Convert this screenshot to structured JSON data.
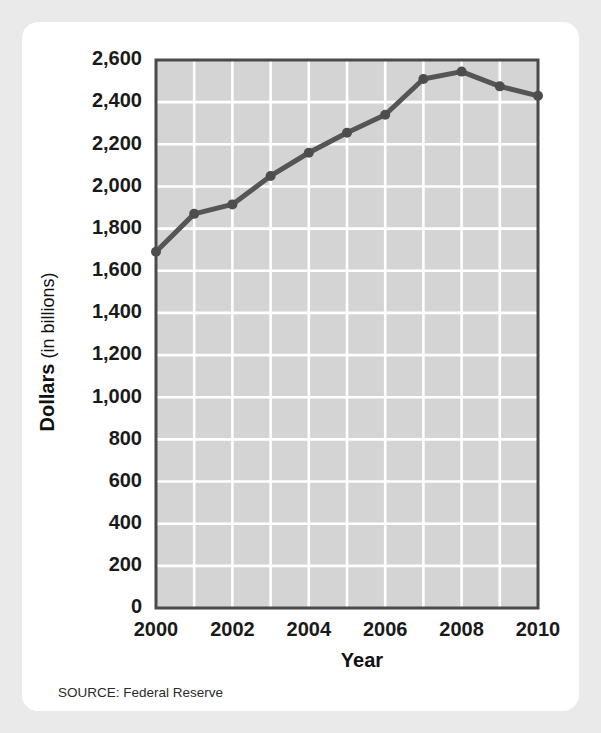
{
  "chart_data": {
    "type": "line",
    "title": "",
    "xlabel": "Year",
    "ylabel": "Dollars (in billions)",
    "ylabel_bold_part": "Dollars",
    "ylabel_regular_part": "(in billions)",
    "x": [
      2000,
      2001,
      2002,
      2003,
      2004,
      2005,
      2006,
      2007,
      2008,
      2009,
      2010
    ],
    "values": [
      1690,
      1870,
      1915,
      2050,
      2160,
      2255,
      2340,
      2510,
      2545,
      2475,
      2430
    ],
    "series": [
      {
        "name": "Dollars (in billions)",
        "values": [
          1690,
          1870,
          1915,
          2050,
          2160,
          2255,
          2340,
          2510,
          2545,
          2475,
          2430
        ]
      }
    ],
    "xlim": [
      2000,
      2010
    ],
    "ylim": [
      0,
      2600
    ],
    "ytick_values": [
      0,
      200,
      400,
      600,
      800,
      1000,
      1200,
      1400,
      1600,
      1800,
      2000,
      2200,
      2400,
      2600
    ],
    "ytick_labels": [
      "0",
      "200",
      "400",
      "600",
      "800",
      "1,000",
      "1,200",
      "1,400",
      "1,600",
      "1,800",
      "2,000",
      "2,200",
      "2,400",
      "2,600"
    ],
    "xtick_values": [
      2000,
      2002,
      2004,
      2006,
      2008,
      2010
    ],
    "xtick_labels": [
      "2000",
      "2002",
      "2004",
      "2006",
      "2008",
      "2010"
    ],
    "grid": true,
    "grid_color": "#ffffff",
    "plot_background": "#d4d4d4",
    "line_color": "#555555",
    "marker_color": "#4d4d4d",
    "legend": null,
    "legend_position": "none",
    "annotations": []
  },
  "source": {
    "label": "SOURCE: Federal Reserve"
  },
  "colors": {
    "page_background": "#eaeaea",
    "card_background": "#ffffff",
    "text": "#1a1a1a",
    "plot_fill": "#d4d4d4",
    "frame": "#4a4a4a",
    "grid": "#ffffff",
    "line": "#555555"
  }
}
